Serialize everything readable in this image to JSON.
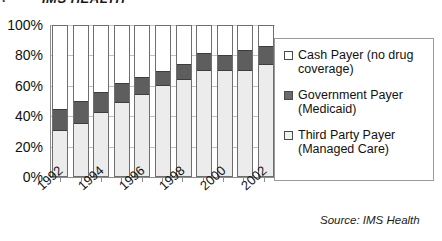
{
  "header": {
    "title": "IMS HEALTH",
    "tick_glyph": "·"
  },
  "chart_data": {
    "type": "bar",
    "subtype": "stacked-100-percent",
    "title": "",
    "xlabel": "",
    "ylabel": "",
    "ylim": [
      0,
      100
    ],
    "ytick_labels": [
      "100%",
      "80%",
      "60%",
      "40%",
      "20%",
      "0%"
    ],
    "ytick_values": [
      100,
      80,
      60,
      40,
      20,
      0
    ],
    "grid": true,
    "legend_position": "right",
    "categories": [
      "1992",
      "1993",
      "1994",
      "1995",
      "1996",
      "1997",
      "1998",
      "1999",
      "2000",
      "2001",
      "2002"
    ],
    "visible_tick_labels": [
      "1992",
      "1994",
      "1996",
      "1998",
      "2000",
      "2002"
    ],
    "series": [
      {
        "name": "Cash Payer (no drug coverage)",
        "color": "#ffffff",
        "values": [
          55,
          50,
          44,
          38,
          34,
          30,
          25,
          18,
          19,
          16,
          13
        ]
      },
      {
        "name": "Government Payer (Medicaid)",
        "color": "#5e5e5e",
        "values": [
          15,
          15,
          14,
          13,
          12,
          10,
          11,
          12,
          11,
          14,
          13
        ]
      },
      {
        "name": "Third Party Payer (Managed Care)",
        "color": "#ececec",
        "values": [
          30,
          35,
          42,
          49,
          54,
          60,
          64,
          70,
          70,
          70,
          74
        ]
      }
    ]
  },
  "legend": {
    "items": [
      {
        "label": "Cash Payer (no drug coverage)",
        "swatch": "cash-swatch"
      },
      {
        "label": "Government Payer (Medicaid)",
        "swatch": "government-swatch"
      },
      {
        "label": "Third Party Payer (Managed Care)",
        "swatch": "third-party-swatch"
      }
    ]
  },
  "source": {
    "text": "Source:  IMS Health"
  }
}
